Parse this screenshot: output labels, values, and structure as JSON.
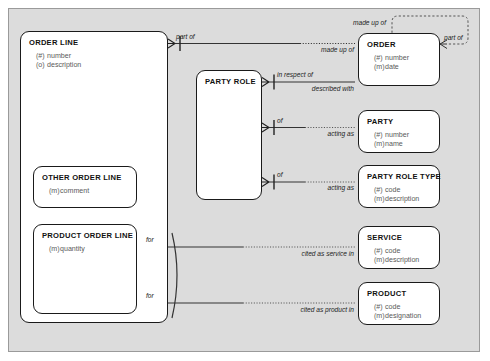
{
  "diagram": {
    "background_color": "#dcdcdc",
    "frame_border_color": "#9a9a9a",
    "entity_fill": "#ffffff",
    "entity_border_color": "#1a1a1a"
  },
  "entities": [
    {
      "id": "order-line",
      "name": "ORDER LINE",
      "attributes": [
        {
          "marker": "(#)",
          "label": "number"
        },
        {
          "marker": "(o)",
          "label": "description"
        }
      ]
    },
    {
      "id": "other-order-line",
      "name": "OTHER ORDER LINE",
      "attributes": [
        {
          "marker": "(m)",
          "label": "comment"
        }
      ]
    },
    {
      "id": "product-order-line",
      "name": "PRODUCT ORDER LINE",
      "attributes": [
        {
          "marker": "(m)",
          "label": "quantity"
        }
      ]
    },
    {
      "id": "party-role",
      "name": "PARTY ROLE",
      "attributes": []
    },
    {
      "id": "order",
      "name": "ORDER",
      "attributes": [
        {
          "marker": "(#)",
          "label": "number"
        },
        {
          "marker": "(m)",
          "label": "date"
        }
      ]
    },
    {
      "id": "party",
      "name": "PARTY",
      "attributes": [
        {
          "marker": "(#)",
          "label": "number"
        },
        {
          "marker": "(m)",
          "label": "name"
        }
      ]
    },
    {
      "id": "party-role-type",
      "name": "PARTY ROLE TYPE",
      "attributes": [
        {
          "marker": "(#)",
          "label": "code"
        },
        {
          "marker": "(m)",
          "label": "description"
        }
      ]
    },
    {
      "id": "service",
      "name": "SERVICE",
      "attributes": [
        {
          "marker": "(#)",
          "label": "code"
        },
        {
          "marker": "(m)",
          "label": "description"
        }
      ]
    },
    {
      "id": "product",
      "name": "PRODUCT",
      "attributes": [
        {
          "marker": "(#)",
          "label": "code"
        },
        {
          "marker": "(m)",
          "label": "designation"
        }
      ]
    }
  ],
  "relationship_labels": {
    "order_line_part_of": "part of",
    "order_made_up_of": "made up of",
    "order_self_made_up_of": "made up of",
    "order_self_part_of": "part of",
    "party_role_in_respect_of": "in respect of",
    "order_described_with": "described with",
    "party_role_of_party": "of",
    "party_acting_as": "acting as",
    "party_role_of_type": "of",
    "party_role_type_acting_as": "acting as",
    "product_order_line_for_service": "for",
    "service_cited_as_service_in": "cited as service in",
    "product_order_line_for_product": "for",
    "product_cited_as_product_in": "cited as product in"
  }
}
